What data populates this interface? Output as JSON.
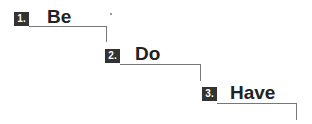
{
  "steps": [
    {
      "number": "1.",
      "label": "Be"
    },
    {
      "number": "2.",
      "label": "Do"
    },
    {
      "number": "3.",
      "label": "Have"
    }
  ],
  "colors": {
    "badge": "#333333",
    "text": "#222222",
    "line": "#777777"
  }
}
